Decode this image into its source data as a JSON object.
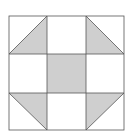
{
  "diagram": {
    "type": "quilt-block",
    "grid": {
      "rows": 3,
      "cols": 3
    },
    "colors": {
      "background": "#ffffff",
      "shade": "#cfcfcf",
      "line": "#555555"
    },
    "bounds": {
      "x0": 9,
      "y0": 16,
      "x1": 124,
      "y1": 130
    },
    "cells": [
      {
        "row": 0,
        "col": 0,
        "fill": "half-triangle",
        "shaded_corner": "bottom-right"
      },
      {
        "row": 0,
        "col": 1,
        "fill": "none"
      },
      {
        "row": 0,
        "col": 2,
        "fill": "half-triangle",
        "shaded_corner": "bottom-left"
      },
      {
        "row": 1,
        "col": 0,
        "fill": "none"
      },
      {
        "row": 1,
        "col": 1,
        "fill": "full"
      },
      {
        "row": 1,
        "col": 2,
        "fill": "none"
      },
      {
        "row": 2,
        "col": 0,
        "fill": "half-triangle",
        "shaded_corner": "top-right"
      },
      {
        "row": 2,
        "col": 1,
        "fill": "none"
      },
      {
        "row": 2,
        "col": 2,
        "fill": "half-triangle",
        "shaded_corner": "top-left"
      }
    ]
  }
}
